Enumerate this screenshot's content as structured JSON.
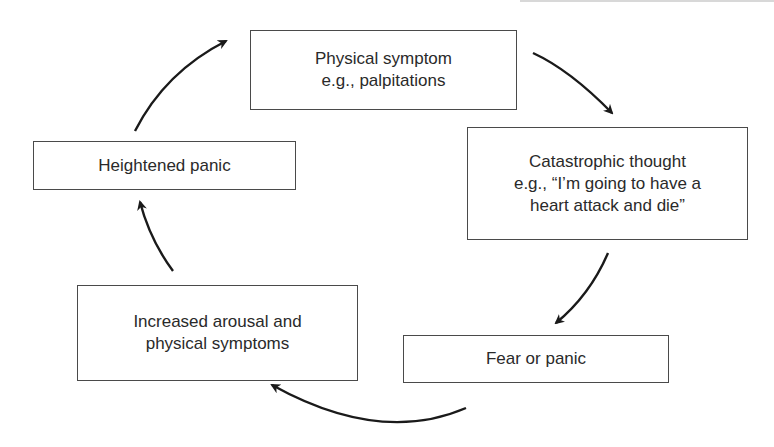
{
  "diagram": {
    "type": "cycle",
    "nodes": [
      {
        "id": "physical-symptom",
        "lines": [
          "Physical symptom",
          "e.g., palpitations"
        ]
      },
      {
        "id": "catastrophic-thought",
        "lines": [
          "Catastrophic thought",
          "e.g., “I’m going to have a",
          "heart attack and die”"
        ]
      },
      {
        "id": "fear-or-panic",
        "lines": [
          "Fear or panic"
        ]
      },
      {
        "id": "increased-arousal",
        "lines": [
          "Increased arousal and",
          "physical symptoms"
        ]
      },
      {
        "id": "heightened-panic",
        "lines": [
          "Heightened panic"
        ]
      }
    ],
    "edges": [
      {
        "from": "physical-symptom",
        "to": "catastrophic-thought"
      },
      {
        "from": "catastrophic-thought",
        "to": "fear-or-panic"
      },
      {
        "from": "fear-or-panic",
        "to": "increased-arousal"
      },
      {
        "from": "increased-arousal",
        "to": "heightened-panic"
      },
      {
        "from": "heightened-panic",
        "to": "physical-symptom"
      }
    ],
    "colors": {
      "box_border": "#4a4a4a",
      "arrow": "#1a1a1a",
      "text": "#2a2a2a",
      "background": "#ffffff"
    }
  }
}
